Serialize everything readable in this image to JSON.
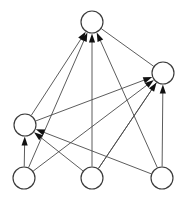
{
  "figure": {
    "background_color": "#ffffff",
    "width": 183,
    "height": 197
  },
  "style": {
    "node_fill": "#ffffff",
    "node_stroke": "#3a3a3a",
    "node_radius": 11,
    "node_stroke_width": 1.15,
    "edge_color": "#4a4a4a",
    "edge_width": 0.9,
    "arrow_color": "#111111",
    "arrow_length": 9,
    "arrow_halfwidth": 3.1
  },
  "graph_data": {
    "type": "directed-graph",
    "directed": true,
    "node_count": 6,
    "edge_count": 13,
    "nodes": [
      {
        "id": "n1",
        "label": "",
        "cx": 92,
        "cy": 22,
        "r": 11,
        "role": "sink-top"
      },
      {
        "id": "n2",
        "label": "",
        "cx": 163,
        "cy": 73,
        "r": 11,
        "role": "sink-right"
      },
      {
        "id": "n3",
        "label": "",
        "cx": 25,
        "cy": 125,
        "r": 11,
        "role": "mid-left"
      },
      {
        "id": "n4",
        "label": "",
        "cx": 24,
        "cy": 178,
        "r": 11,
        "role": "source-bottom-left"
      },
      {
        "id": "n5",
        "label": "",
        "cx": 92,
        "cy": 178,
        "r": 11,
        "role": "source-bottom-mid"
      },
      {
        "id": "n6",
        "label": "",
        "cx": 162,
        "cy": 178,
        "r": 11,
        "role": "source-bottom-right"
      }
    ],
    "edges": [
      {
        "from": "n3",
        "to": "n1",
        "arrow": true
      },
      {
        "from": "n4",
        "to": "n1",
        "arrow": true
      },
      {
        "from": "n5",
        "to": "n1",
        "arrow": true
      },
      {
        "from": "n6",
        "to": "n1",
        "arrow": true
      },
      {
        "from": "n3",
        "to": "n2",
        "arrow": true
      },
      {
        "from": "n4",
        "to": "n2",
        "arrow": true
      },
      {
        "from": "n5",
        "to": "n2",
        "arrow": true
      },
      {
        "from": "n6",
        "to": "n2",
        "arrow": true
      },
      {
        "from": "n4",
        "to": "n3",
        "arrow": true
      },
      {
        "from": "n5",
        "to": "n3",
        "arrow": true
      },
      {
        "from": "n6",
        "to": "n3",
        "arrow": true
      },
      {
        "from": "n1",
        "to": "n2",
        "arrow": false
      },
      {
        "from": "n2",
        "to": "n5",
        "arrow": false
      }
    ]
  }
}
